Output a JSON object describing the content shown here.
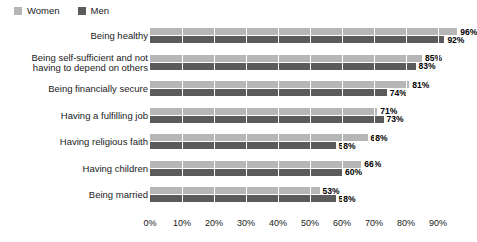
{
  "legend": {
    "position": "top-left",
    "entries": [
      {
        "label": "Women",
        "color": "#b6b6b6",
        "icon": "square-swatch-icon"
      },
      {
        "label": "Men",
        "color": "#5b5b5b",
        "icon": "square-swatch-icon"
      }
    ]
  },
  "chart_data": {
    "type": "bar",
    "orientation": "horizontal",
    "title": "",
    "subtitle": "",
    "xlabel": "",
    "ylabel": "",
    "xlim": [
      0,
      100
    ],
    "grid": true,
    "grid_axis": "x",
    "legend_position": "top-left",
    "value_suffix": "%",
    "xticks": [
      0,
      10,
      20,
      30,
      40,
      50,
      60,
      70,
      80,
      90
    ],
    "xtick_labels": [
      "0%",
      "10%",
      "20%",
      "30%",
      "40%",
      "50%",
      "60%",
      "70%",
      "80%",
      "90%"
    ],
    "categories": [
      "Being healthy",
      "Being self-sufficient and not\nhaving to depend on others",
      "Being financially secure",
      "Having a fulfilling job",
      "Having religious faith",
      "Having children",
      "Being married"
    ],
    "series": [
      {
        "name": "Women",
        "color": "#b6b6b6",
        "values": [
          96,
          85,
          81,
          71,
          68,
          66,
          53
        ],
        "labels": [
          "96%",
          "85%",
          "81%",
          "71%",
          "68%",
          "66%",
          "53%"
        ]
      },
      {
        "name": "Men",
        "color": "#5b5b5b",
        "values": [
          92,
          83,
          74,
          73,
          58,
          60,
          58
        ],
        "labels": [
          "92%",
          "83%",
          "74%",
          "73%",
          "58%",
          "60%",
          "58%"
        ]
      }
    ]
  }
}
